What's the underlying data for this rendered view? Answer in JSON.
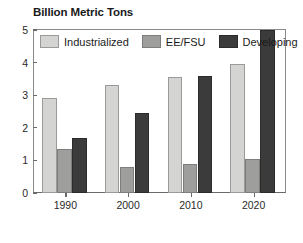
{
  "chart_data": {
    "type": "bar",
    "title": "Billion Metric Tons",
    "xlabel": "",
    "ylabel": "",
    "ylim": [
      0,
      5
    ],
    "yticks": [
      0,
      1,
      2,
      3,
      4,
      5
    ],
    "ytick_labels": [
      "0",
      "1",
      "2",
      "3",
      "4",
      "5"
    ],
    "grid": false,
    "legend_position": "top-left-inside",
    "categories": [
      "1990",
      "2000",
      "2010",
      "2020"
    ],
    "series": [
      {
        "name": "Industrialized",
        "color": "#d4d4d2",
        "values": [
          2.9,
          3.3,
          3.55,
          3.95
        ]
      },
      {
        "name": "EE/FSU",
        "color": "#9e9e9c",
        "values": [
          1.35,
          0.8,
          0.9,
          1.05
        ]
      },
      {
        "name": "Developing",
        "color": "#3b3b3b",
        "values": [
          1.7,
          2.45,
          3.6,
          5.0
        ]
      }
    ]
  },
  "colors": {
    "industrialized": "#d4d4d2",
    "eefsu": "#9e9e9c",
    "developing": "#3b3b3b",
    "axis": "#6a6a6a",
    "text": "#1a1a1a",
    "background": "#ffffff"
  }
}
